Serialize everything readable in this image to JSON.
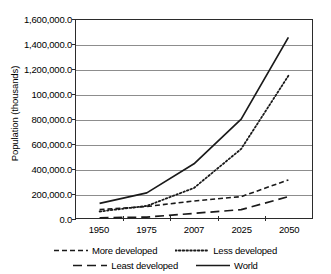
{
  "chart_data": {
    "type": "line",
    "title": "",
    "xlabel": "",
    "ylabel": "Population (thousands)",
    "categories": [
      "1950",
      "1975",
      "2007",
      "2025",
      "2050"
    ],
    "ylim": [
      0,
      1600000
    ],
    "ytick_labels": [
      "1,600,000.0",
      "1,400,000.0",
      "1,200,000.0",
      "100,000.0",
      "800,000.0",
      "600,000.0",
      "400,000.0",
      "200,000.0",
      "0.0"
    ],
    "ytick_values": [
      1600000,
      1400000,
      1200000,
      1000000,
      800000,
      600000,
      400000,
      200000,
      0
    ],
    "grid": true,
    "legend_position": "bottom",
    "series": [
      {
        "name": "More developed",
        "style": "short-dash",
        "values": [
          70000,
          95000,
          140000,
          175000,
          310000
        ]
      },
      {
        "name": "Less developed",
        "style": "dotted",
        "values": [
          55000,
          100000,
          245000,
          560000,
          1150000
        ]
      },
      {
        "name": "Least developed",
        "style": "long-dash",
        "values": [
          4000,
          10000,
          40000,
          70000,
          175000
        ]
      },
      {
        "name": "World",
        "style": "solid",
        "values": [
          120000,
          205000,
          440000,
          800000,
          1460000
        ]
      }
    ]
  },
  "legend": {
    "items": [
      {
        "label": "More developed",
        "style": "short-dash"
      },
      {
        "label": "Less developed",
        "style": "dotted"
      },
      {
        "label": "Least developed",
        "style": "long-dash"
      },
      {
        "label": "World",
        "style": "solid"
      }
    ]
  },
  "colors": {
    "line": "#1a1a1a",
    "grid": "#8d8d8d",
    "axis": "#2b2b2b",
    "background": "#ffffff"
  }
}
